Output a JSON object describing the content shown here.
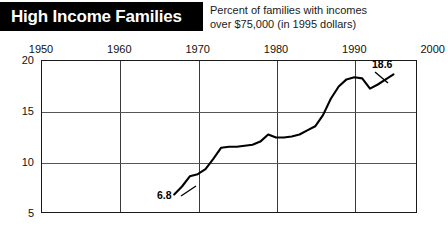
{
  "header": {
    "banner_title": "High Income Families",
    "subtitle_line1": "Percent of families with incomes",
    "subtitle_line2": "over $75,000 (in 1995 dollars)",
    "banner_bg": "#000000",
    "banner_fg": "#ffffff"
  },
  "chart_data": {
    "type": "line",
    "title": "High Income Families",
    "subtitle": "Percent of families with incomes over $75,000 (in 1995 dollars)",
    "xlabel": "",
    "ylabel": "",
    "xlim": [
      1950,
      2000
    ],
    "ylim": [
      5,
      20
    ],
    "grid": true,
    "legend": null,
    "xticks": [
      "1950",
      "1960",
      "1970",
      "1980",
      "1990",
      "2000"
    ],
    "yticks": [
      "20",
      "15",
      "10",
      "5"
    ],
    "line_color": "#000000",
    "annotations": [
      {
        "text": "6.8",
        "x": 1967,
        "y": 6.8
      },
      {
        "text": "18.6",
        "x": 1995,
        "y": 18.6
      }
    ],
    "x": [
      1967,
      1968,
      1969,
      1970,
      1971,
      1972,
      1973,
      1974,
      1975,
      1976,
      1977,
      1978,
      1979,
      1980,
      1981,
      1982,
      1983,
      1984,
      1985,
      1986,
      1987,
      1988,
      1989,
      1990,
      1991,
      1992,
      1993,
      1994,
      1995
    ],
    "values": [
      6.8,
      7.6,
      8.6,
      8.8,
      9.3,
      10.3,
      11.4,
      11.5,
      11.5,
      11.6,
      11.7,
      12.0,
      12.7,
      12.4,
      12.4,
      12.5,
      12.7,
      13.1,
      13.5,
      14.6,
      16.2,
      17.4,
      18.1,
      18.3,
      18.2,
      17.2,
      17.6,
      18.1,
      18.6
    ]
  }
}
